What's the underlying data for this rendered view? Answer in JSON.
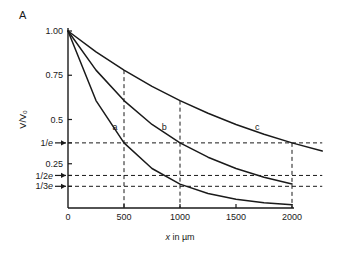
{
  "panel": {
    "label": "A"
  },
  "chart_data": {
    "type": "line",
    "title": "",
    "xlabel": "x in µm",
    "ylabel": "V/V₀",
    "xlim": [
      0,
      2270
    ],
    "ylim": [
      0,
      1.0
    ],
    "grid": false,
    "legend_position": "inline-curve-labels",
    "x_ticks": [
      {
        "value": 0,
        "label": "0"
      },
      {
        "value": 500,
        "label": "500"
      },
      {
        "value": 1000,
        "label": "1000"
      },
      {
        "value": 1500,
        "label": "1500"
      },
      {
        "value": 2000,
        "label": "2000"
      }
    ],
    "y_ticks": [
      {
        "value": 1.0,
        "label": "1.00",
        "arrow": false
      },
      {
        "value": 0.75,
        "label": "0.75",
        "arrow": false
      },
      {
        "value": 0.5,
        "label": "0.5",
        "arrow": false
      },
      {
        "value": 0.3679,
        "label": "1/e",
        "arrow": true
      },
      {
        "value": 0.25,
        "label": "0.25",
        "arrow": false
      },
      {
        "value": 0.1839,
        "label": "1/2e",
        "arrow": true
      },
      {
        "value": 0.1226,
        "label": "1/3e",
        "arrow": true
      }
    ],
    "series": [
      {
        "name": "a",
        "label": "a",
        "lambda_um": 500,
        "equation": "V/V0 = exp(-x/500)",
        "label_x": 420,
        "label_y": 0.44,
        "points": [
          {
            "x": 0,
            "y": 1.0
          },
          {
            "x": 250,
            "y": 0.607
          },
          {
            "x": 500,
            "y": 0.368
          },
          {
            "x": 750,
            "y": 0.223
          },
          {
            "x": 1000,
            "y": 0.135
          },
          {
            "x": 1250,
            "y": 0.082
          },
          {
            "x": 1500,
            "y": 0.05
          },
          {
            "x": 1750,
            "y": 0.03
          },
          {
            "x": 2000,
            "y": 0.018
          }
        ]
      },
      {
        "name": "b",
        "label": "b",
        "lambda_um": 1000,
        "equation": "V/V0 = exp(-x/1000)",
        "label_x": 860,
        "label_y": 0.44,
        "points": [
          {
            "x": 0,
            "y": 1.0
          },
          {
            "x": 250,
            "y": 0.779
          },
          {
            "x": 500,
            "y": 0.607
          },
          {
            "x": 750,
            "y": 0.472
          },
          {
            "x": 1000,
            "y": 0.368
          },
          {
            "x": 1250,
            "y": 0.287
          },
          {
            "x": 1500,
            "y": 0.223
          },
          {
            "x": 1750,
            "y": 0.174
          },
          {
            "x": 2000,
            "y": 0.135
          }
        ]
      },
      {
        "name": "c",
        "label": "c",
        "lambda_um": 2000,
        "equation": "V/V0 = exp(-x/2000)",
        "label_x": 1690,
        "label_y": 0.44,
        "points": [
          {
            "x": 0,
            "y": 1.0
          },
          {
            "x": 250,
            "y": 0.882
          },
          {
            "x": 500,
            "y": 0.779
          },
          {
            "x": 750,
            "y": 0.687
          },
          {
            "x": 1000,
            "y": 0.607
          },
          {
            "x": 1250,
            "y": 0.535
          },
          {
            "x": 1500,
            "y": 0.472
          },
          {
            "x": 1750,
            "y": 0.417
          },
          {
            "x": 2000,
            "y": 0.368
          },
          {
            "x": 2270,
            "y": 0.322
          }
        ]
      }
    ],
    "reference_lines": {
      "horizontal": [
        {
          "value": 0.3679,
          "label": "1/e"
        },
        {
          "value": 0.1839,
          "label": "1/2e"
        },
        {
          "value": 0.1226,
          "label": "1/3e"
        }
      ],
      "vertical": [
        {
          "value": 500
        },
        {
          "value": 1000
        },
        {
          "value": 2000
        }
      ]
    },
    "colors": {
      "curve": "#1a1a1a",
      "axis": "#1a1a1a",
      "dashed": "#1a1a1a",
      "background": "#ffffff"
    }
  }
}
